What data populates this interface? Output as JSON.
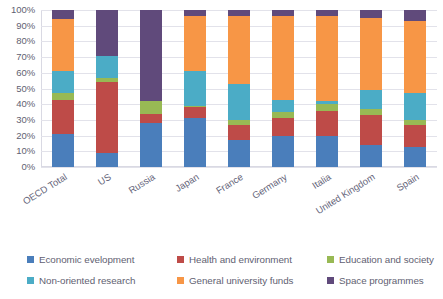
{
  "chart_data": {
    "type": "bar",
    "subtype": "stacked-100-percent",
    "title": "",
    "subtitle": "",
    "xlabel": "",
    "ylabel": "",
    "ylim": [
      0,
      100
    ],
    "yunit": "%",
    "grid": true,
    "legend_position": "bottom",
    "categories": [
      "OECD Total",
      "US",
      "Russia",
      "Japan",
      "France",
      "Germany",
      "Italia",
      "United Kingdom",
      "Spain"
    ],
    "ytick_labels": [
      "0%",
      "10%",
      "20%",
      "30%",
      "40%",
      "50%",
      "60%",
      "70%",
      "80%",
      "90%",
      "100%"
    ],
    "ytick_values": [
      0,
      10,
      20,
      30,
      40,
      50,
      60,
      70,
      80,
      90,
      100
    ],
    "series": [
      {
        "name": "Economic evelopment",
        "color": "#4a7ebb",
        "values": [
          21,
          9,
          28,
          31,
          17,
          20,
          20,
          14,
          13
        ]
      },
      {
        "name": "Health and environment",
        "color": "#be4b48",
        "values": [
          22,
          45,
          6,
          7,
          10,
          11,
          16,
          19,
          14
        ]
      },
      {
        "name": "Education and society",
        "color": "#98b954",
        "values": [
          4,
          3,
          8,
          1,
          3,
          4,
          4,
          4,
          3
        ]
      },
      {
        "name": "Non-oriented research",
        "color": "#4bacc6",
        "values": [
          14,
          14,
          0,
          22,
          23,
          8,
          2,
          12,
          17
        ]
      },
      {
        "name": "General university funds",
        "color": "#f79646",
        "values": [
          33,
          0,
          0,
          35,
          43,
          53,
          54,
          46,
          46
        ]
      },
      {
        "name": "Space programmes",
        "color": "#604a7b",
        "values": [
          6,
          29,
          58,
          4,
          4,
          4,
          4,
          5,
          7
        ]
      }
    ]
  },
  "colors": {
    "economic_development": "#4a7ebb",
    "health_environment": "#be4b48",
    "education_society": "#98b954",
    "non_oriented_research": "#4bacc6",
    "general_university_funds": "#f79646",
    "space_programmes": "#604a7b",
    "gridline": "#e2e2ea",
    "axis": "#d9d9e3",
    "text": "#5f5f72"
  }
}
